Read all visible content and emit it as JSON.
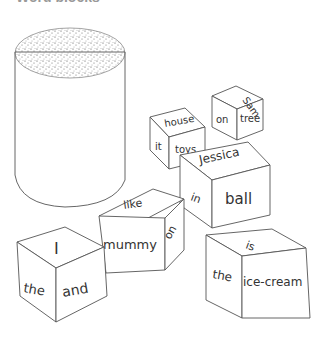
{
  "header": {
    "text": "Word blocks"
  },
  "illustration": {
    "cylinder": {
      "top_texture": "stippled",
      "stroke": "#555555"
    },
    "cubes": [
      {
        "id": "sam-cube",
        "top": "Sam",
        "left": "on",
        "right": "tree"
      },
      {
        "id": "house-cube",
        "top": "house",
        "left": "it",
        "right": "toys"
      },
      {
        "id": "jessica-cube",
        "top": "Jessica",
        "left": "in",
        "right": "ball"
      },
      {
        "id": "like-cube",
        "top": "like",
        "left": "mummy",
        "right": "on"
      },
      {
        "id": "i-cube",
        "top": "I",
        "left": "the",
        "right": "and"
      },
      {
        "id": "is-cube",
        "top": "is",
        "left": "the",
        "right": "ice-cream"
      }
    ]
  },
  "colors": {
    "background": "#ffffff",
    "ink": "#333333",
    "stipple": "#444444"
  }
}
